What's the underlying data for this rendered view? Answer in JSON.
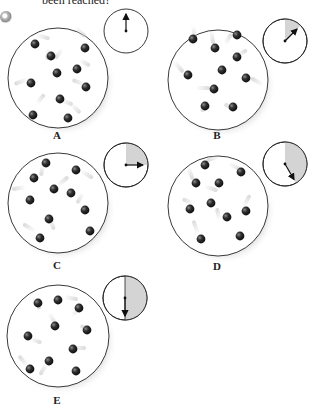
{
  "caption": "been reached?",
  "colors": {
    "outline": "#222222",
    "ball": "#2a2a2a",
    "ball_highlight": "#8a8a8a",
    "trail": "#d9d9d9",
    "clock_fill": "#d4d4d4",
    "shadow": "#bdbdbd"
  },
  "panels": [
    {
      "id": "A",
      "label": "A",
      "clock_elapsed_deg": 0,
      "hand_deg": 0
    },
    {
      "id": "B",
      "label": "B",
      "clock_elapsed_deg": 45,
      "hand_deg": 45
    },
    {
      "id": "C",
      "label": "C",
      "clock_elapsed_deg": 90,
      "hand_deg": 90
    },
    {
      "id": "D",
      "label": "D",
      "clock_elapsed_deg": 150,
      "hand_deg": 150
    },
    {
      "id": "E",
      "label": "E",
      "clock_elapsed_deg": 180,
      "hand_deg": 180
    }
  ],
  "icons": {
    "badge": "cd-audio-icon"
  }
}
